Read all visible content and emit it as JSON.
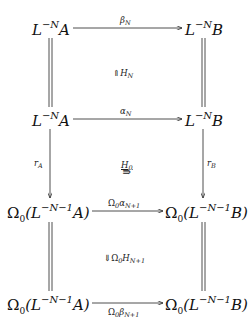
{
  "diagram": {
    "nodes": [
      {
        "id": "tl",
        "base": "L",
        "sup": "−N",
        "tail": "A"
      },
      {
        "id": "tr",
        "base": "L",
        "sup": "−N",
        "tail": "B"
      },
      {
        "id": "ml",
        "base": "L",
        "sup": "−N",
        "tail": "A"
      },
      {
        "id": "mr",
        "base": "L",
        "sup": "−N",
        "tail": "B"
      },
      {
        "id": "bl1",
        "pre": "Ω",
        "presub": "0",
        "open": "(L",
        "sup": "−N−1",
        "tail": "A)"
      },
      {
        "id": "br1",
        "pre": "Ω",
        "presub": "0",
        "open": "(L",
        "sup": "−N−1",
        "tail": "B)"
      },
      {
        "id": "bl2",
        "pre": "Ω",
        "presub": "0",
        "open": "(L",
        "sup": "−N−1",
        "tail": "A)"
      },
      {
        "id": "br2",
        "pre": "Ω",
        "presub": "0",
        "open": "(L",
        "sup": "−N−1",
        "tail": "B)"
      }
    ],
    "labels": {
      "beta_N": {
        "main": "β",
        "sub": "N"
      },
      "H_N": {
        "prefix": "⇑",
        "main": "H",
        "sub": "N"
      },
      "alpha_N": {
        "main": "α",
        "sub": "N"
      },
      "r_A": {
        "main": "r",
        "sub": "A"
      },
      "r_B": {
        "main": "r",
        "sub": "B"
      },
      "H_0": {
        "main": "H",
        "sub": "0",
        "arrow": "⇛"
      },
      "Omega_alpha": {
        "pre": "Ω",
        "presub": "0",
        "main": "α",
        "sub": "N+1"
      },
      "Omega_H": {
        "prefix": "⇓",
        "pre": "Ω",
        "presub": "0",
        "main": "H",
        "sub": "N+1"
      },
      "Omega_beta": {
        "pre": "Ω",
        "presub": "0",
        "main": "β",
        "sub": "N+1"
      }
    }
  }
}
